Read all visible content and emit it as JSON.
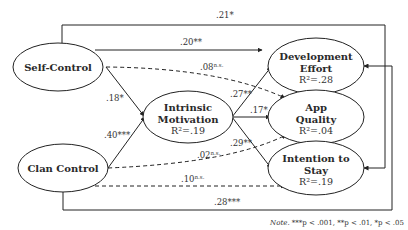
{
  "nodes": {
    "self_control": {
      "title": "Self-Control"
    },
    "clan_control": {
      "title": "Clan Control"
    },
    "intrinsic_motivation": {
      "line1": "Intrinsic",
      "line2": "Motivation",
      "r2": "R²=.19"
    },
    "development_effort": {
      "line1": "Development",
      "line2": "Effort",
      "r2": "R²=.28"
    },
    "app_quality": {
      "line1": "App",
      "line2": "Quality",
      "r2": "R²=.04"
    },
    "intention_to_stay": {
      "line1": "Intention to",
      "line2": "Stay",
      "r2": "R²=.19"
    }
  },
  "paths": {
    "sc_to_ise": ".21*",
    "sc_to_de": ".20**",
    "sc_to_aq": ".08",
    "sc_to_aq_sup": "n.s.",
    "sc_to_im": ".18*",
    "cc_to_im": ".40***",
    "im_to_de": ".27**",
    "im_to_aq": ".17*",
    "im_to_its": ".29**",
    "cc_to_aq": ".02",
    "cc_to_aq_sup": "n.s.",
    "cc_to_its": ".10",
    "cc_to_its_sup": "n.s.",
    "cc_to_de": ".28***"
  },
  "note": {
    "label": "Note.",
    "text": " ***p < .001, **p < .01, *p < .05"
  }
}
